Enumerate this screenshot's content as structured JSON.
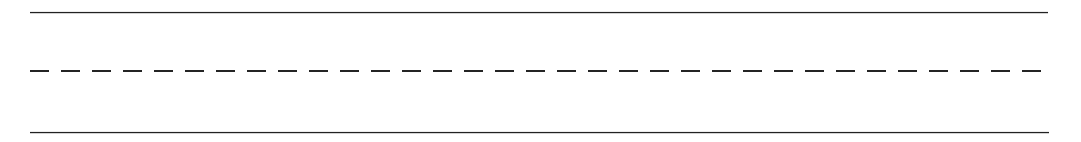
{
  "page": {
    "width": 1081,
    "height": 142,
    "background_color": "#ffffff"
  },
  "rules": {
    "stroke_color": "#222222",
    "dash_color": "#242424",
    "top": {
      "name": "top solid rule",
      "style": "solid",
      "x_start": 30,
      "x_end": 1048,
      "y": 12,
      "thickness_px": 1.6,
      "length_px": 1018
    },
    "middle": {
      "name": "middle dashed rule",
      "style": "dashed",
      "x_start": 30,
      "x_end": 1044,
      "y": 71,
      "thickness_px": 2.6,
      "length_px": 1015,
      "dash_length_px": 19,
      "gap_length_px": 12,
      "dash_period_px": 31,
      "dash_count": 33
    },
    "bottom": {
      "name": "bottom solid rule",
      "style": "solid",
      "x_start": 30,
      "x_end": 1049,
      "y": 132,
      "thickness_px": 1.6,
      "length_px": 1018
    }
  },
  "spacing": {
    "top_to_middle_px": 59,
    "middle_to_bottom_px": 61,
    "left_margin_px": 30,
    "right_margin_px": 33
  }
}
